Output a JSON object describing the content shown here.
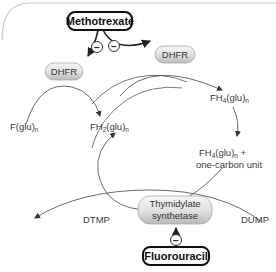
{
  "diagram": {
    "drugs": {
      "methotrexate": "Methotrexate",
      "fluorouracil": "Fluorouracil"
    },
    "enzymes": {
      "dhfr_left": "DHFR",
      "dhfr_top": "DHFR",
      "thymidylate_synthetase_line1": "Thymidylate",
      "thymidylate_synthetase_line2": "synthetase"
    },
    "inhibition_symbol": "−",
    "metabolites": {
      "f_glu": {
        "base": "F(glu)",
        "subscript": "n"
      },
      "fh2_glu": {
        "base": "FH",
        "sub1": "2",
        "mid": "(glu)",
        "sub2": "n"
      },
      "fh4_glu": {
        "base": "FH",
        "sub1": "4",
        "mid": "(glu)",
        "sub2": "n"
      },
      "fh4_glu_one_carbon_line1": {
        "base": "FH",
        "sub1": "4",
        "mid": "(glu)",
        "sub2": "n",
        "suffix": " +"
      },
      "fh4_glu_one_carbon_line2": "one-carbon unit",
      "dtmp": "DTMP",
      "dump": "DUMP"
    },
    "colors": {
      "frame": "#c8c8c8",
      "arrow": "#333333",
      "enzyme_fill_top": "#f4f4f4",
      "enzyme_fill_bottom": "#bdbdbd",
      "drug_border": "#111111"
    }
  }
}
